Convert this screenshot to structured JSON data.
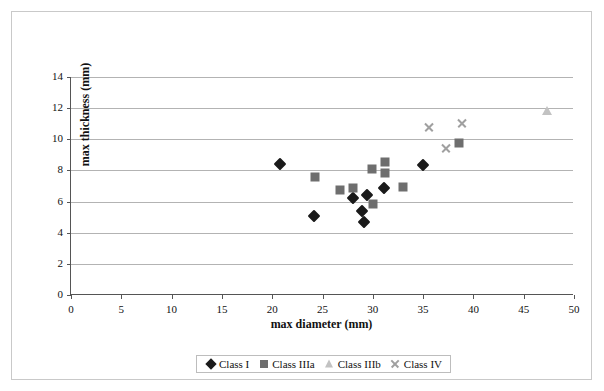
{
  "chart_data": {
    "type": "scatter",
    "title": "",
    "xlabel": "max diameter (mm)",
    "ylabel": "max thickness (mm)",
    "xlim": [
      0,
      50
    ],
    "ylim": [
      0,
      14
    ],
    "xticks": [
      0,
      5,
      10,
      15,
      20,
      25,
      30,
      35,
      40,
      45,
      50
    ],
    "yticks": [
      0,
      2,
      4,
      6,
      8,
      10,
      12,
      14
    ],
    "grid": "horizontal",
    "legend_position": "bottom",
    "series": [
      {
        "name": "Class I",
        "marker": "diamond",
        "color": "#1a1a1a",
        "points": [
          {
            "x": 20.8,
            "y": 8.4
          },
          {
            "x": 24.2,
            "y": 5.1
          },
          {
            "x": 28.0,
            "y": 6.25
          },
          {
            "x": 28.9,
            "y": 5.4
          },
          {
            "x": 29.1,
            "y": 4.7
          },
          {
            "x": 29.4,
            "y": 6.45
          },
          {
            "x": 31.1,
            "y": 6.85
          },
          {
            "x": 35.0,
            "y": 8.35
          }
        ]
      },
      {
        "name": "Class IIIa",
        "marker": "square",
        "color": "#6e6e6e",
        "points": [
          {
            "x": 24.3,
            "y": 7.6
          },
          {
            "x": 26.7,
            "y": 6.75
          },
          {
            "x": 28.0,
            "y": 6.9
          },
          {
            "x": 29.9,
            "y": 8.1
          },
          {
            "x": 30.0,
            "y": 5.85
          },
          {
            "x": 31.2,
            "y": 8.55
          },
          {
            "x": 31.2,
            "y": 7.85
          },
          {
            "x": 33.0,
            "y": 6.95
          },
          {
            "x": 38.6,
            "y": 9.75
          }
        ]
      },
      {
        "name": "Class IIIb",
        "marker": "triangle",
        "color": "#c2c2c2",
        "points": [
          {
            "x": 47.3,
            "y": 11.8
          }
        ]
      },
      {
        "name": "Class IV",
        "marker": "cross",
        "color": "#a0a0a0",
        "points": [
          {
            "x": 35.6,
            "y": 10.75
          },
          {
            "x": 37.3,
            "y": 9.45
          },
          {
            "x": 38.9,
            "y": 11.0
          }
        ]
      }
    ]
  },
  "axes": {
    "x_title": "max diameter (mm)",
    "y_title": "max thickness (mm)",
    "x_tick_labels": [
      "0",
      "5",
      "10",
      "15",
      "20",
      "25",
      "30",
      "35",
      "40",
      "45",
      "50"
    ],
    "y_tick_labels": [
      "0",
      "2",
      "4",
      "6",
      "8",
      "10",
      "12",
      "14"
    ]
  },
  "legend": {
    "items": [
      {
        "label": "Class I",
        "marker": "diamond",
        "color": "#1a1a1a"
      },
      {
        "label": "Class IIIa",
        "marker": "square",
        "color": "#6e6e6e"
      },
      {
        "label": "Class IIIb",
        "marker": "triangle",
        "color": "#c2c2c2"
      },
      {
        "label": "Class IV",
        "marker": "cross",
        "color": "#a0a0a0"
      }
    ]
  },
  "colors": {
    "grid": "#b3b3b3",
    "axis": "#555555",
    "frame": "#c9c9c9",
    "background": "#ffffff",
    "text": "#111111"
  }
}
